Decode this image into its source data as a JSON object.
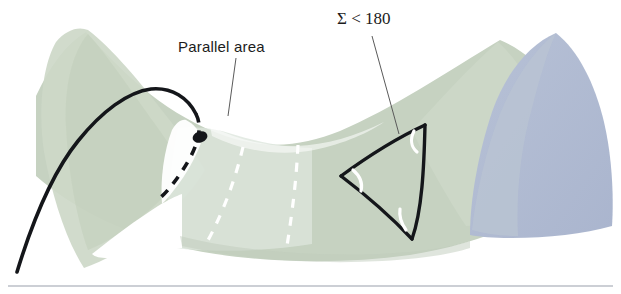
{
  "figure": {
    "kind": "geometry-diagram",
    "background_color": "#ffffff"
  },
  "labels": {
    "parallel_area": {
      "text": "Parallel area",
      "x": 178,
      "y": 52,
      "leader_from": [
        236,
        58
      ],
      "leader_to": [
        228,
        116
      ]
    },
    "angle_sum": {
      "text": "Σ < 180",
      "x": 337,
      "y": 24,
      "leader_from": [
        372,
        36
      ],
      "leader_to": [
        399,
        134
      ]
    }
  },
  "colors": {
    "surface_green_light": "#dde5dc",
    "surface_green_mid": "#ccd7c7",
    "surface_green_deep": "#c2cfbd",
    "surface_blue": "#b4bed4",
    "surface_blue_shadow": "#a8b3cc",
    "ink_black": "#14161a",
    "leader_gray": "#5a5a5a",
    "geodesic_white": "#ffffff",
    "rule_gray": "#9aa0ac"
  },
  "shapes": {
    "left_lobe": {
      "name": "left-peak-lobe",
      "fill": "#ccd7c7",
      "apex": [
        88,
        30
      ]
    },
    "saddle_sheet": {
      "name": "central-saddle-sheet",
      "fill": "#c2cfbd",
      "saddle_low_point": [
        292,
        141
      ]
    },
    "right_lobe_green": {
      "name": "right-peak-lobe-green",
      "fill": "#ccd7c7",
      "apex": [
        500,
        45
      ]
    },
    "right_lobe_blue": {
      "name": "right-peak-lobe-blue",
      "fill": "#b4bed4",
      "apex": [
        556,
        33
      ]
    },
    "front_veil": {
      "name": "translucent-front-veil",
      "fill": "#dde5dc"
    }
  },
  "marked_point": {
    "name": "tangency-point",
    "cx": 200,
    "cy": 137,
    "rx": 7.5,
    "ry": 5.5,
    "rotation": -18,
    "fill": "#14161a"
  },
  "geodesic_curve": {
    "name": "through-line-geodesic",
    "solid_path": "M 17 272 C 28 236 48 178 78 141 C 102 111 128 92 151 89 C 172 87 188 98 196 114",
    "dashed_path": "M 196 114 C 202 126 199 141 190 158 C 180 176 168 191 160 198"
  },
  "parallel_geodesics": [
    {
      "name": "white-dashed-geodesic-left",
      "path": "M 243 147 C 238 168 231 190 222 211 C 216 225 211 235 207 242"
    },
    {
      "name": "white-dashed-geodesic-right",
      "path": "M 298 145 C 297 166 295 189 292 211 C 290 227 288 239 287 246"
    }
  ],
  "triangle": {
    "name": "hyperbolic-geodesic-triangle",
    "vertices": [
      {
        "name": "vertex-top",
        "x": 425,
        "y": 125
      },
      {
        "name": "vertex-left",
        "x": 341,
        "y": 176
      },
      {
        "name": "vertex-bottom",
        "x": 412,
        "y": 239
      }
    ],
    "edges": [
      {
        "name": "edge-top-left",
        "path": "M 425 125 C 399 137 367 157 341 176"
      },
      {
        "name": "edge-left-bottom",
        "path": "M 341 176 C 366 195 394 220 412 239"
      },
      {
        "name": "edge-bottom-top",
        "path": "M 412 239 C 422 211 424 168 425 125"
      }
    ],
    "angle_arcs": [
      {
        "name": "angle-arc-top",
        "path": "M 414 131 C 411 139 412 146 417 151"
      },
      {
        "name": "angle-arc-left",
        "path": "M 352 170 C 359 175 362 182 360 189"
      },
      {
        "name": "angle-arc-bottom",
        "path": "M 406 230 C 401 224 399 217 400 210"
      }
    ]
  },
  "footer_rule": {
    "name": "page-divider-rule",
    "x1": 8,
    "y1": 286,
    "x2": 613,
    "y2": 286
  }
}
